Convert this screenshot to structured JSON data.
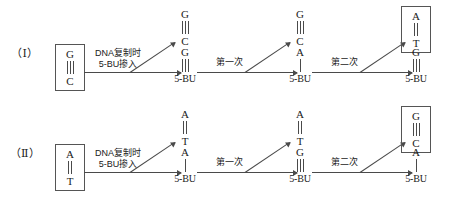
{
  "figure": {
    "rows": [
      {
        "id": "row-1",
        "label": "（Ⅰ）",
        "start": {
          "top": "G",
          "bottom": "C",
          "bonds": 3,
          "boxed": true
        },
        "transition_1": {
          "line1": "DNA复制时",
          "line2": "5-BU掺入"
        },
        "stage_1": {
          "upper": {
            "top": "G",
            "bottom": "C",
            "bonds": 3,
            "boxed": false
          },
          "lower": {
            "top": "G",
            "bottom": "5-BU",
            "bonds": 3,
            "boxed": false
          }
        },
        "transition_2": {
          "line1": "第一次",
          "line2": ""
        },
        "stage_2": {
          "upper": {
            "top": "G",
            "bottom": "C",
            "bonds": 3,
            "boxed": false
          },
          "lower": {
            "top": "A",
            "bottom": "5-BU",
            "bonds": 1,
            "boxed": false
          }
        },
        "transition_3": {
          "line1": "第二次",
          "line2": ""
        },
        "stage_3": {
          "upper": {
            "top": "A",
            "bottom": "T",
            "bonds": 2,
            "boxed": true
          },
          "lower": {
            "top": "G",
            "bottom": "5-BU",
            "bonds": 3,
            "boxed": false
          }
        }
      },
      {
        "id": "row-2",
        "label": "（Ⅱ）",
        "start": {
          "top": "A",
          "bottom": "T",
          "bonds": 2,
          "boxed": true
        },
        "transition_1": {
          "line1": "DNA复制时",
          "line2": "5-BU掺入"
        },
        "stage_1": {
          "upper": {
            "top": "A",
            "bottom": "T",
            "bonds": 2,
            "boxed": false
          },
          "lower": {
            "top": "A",
            "bottom": "5-BU",
            "bonds": 1,
            "boxed": false
          }
        },
        "transition_2": {
          "line1": "第一次",
          "line2": ""
        },
        "stage_2": {
          "upper": {
            "top": "A",
            "bottom": "T",
            "bonds": 2,
            "boxed": false
          },
          "lower": {
            "top": "G",
            "bottom": "5-BU",
            "bonds": 3,
            "boxed": false
          }
        },
        "transition_3": {
          "line1": "第二次",
          "line2": ""
        },
        "stage_3": {
          "upper": {
            "top": "G",
            "bottom": "C",
            "bonds": 3,
            "boxed": true
          },
          "lower": {
            "top": "A",
            "bottom": "5-BU",
            "bonds": 1,
            "boxed": false
          }
        }
      }
    ]
  }
}
